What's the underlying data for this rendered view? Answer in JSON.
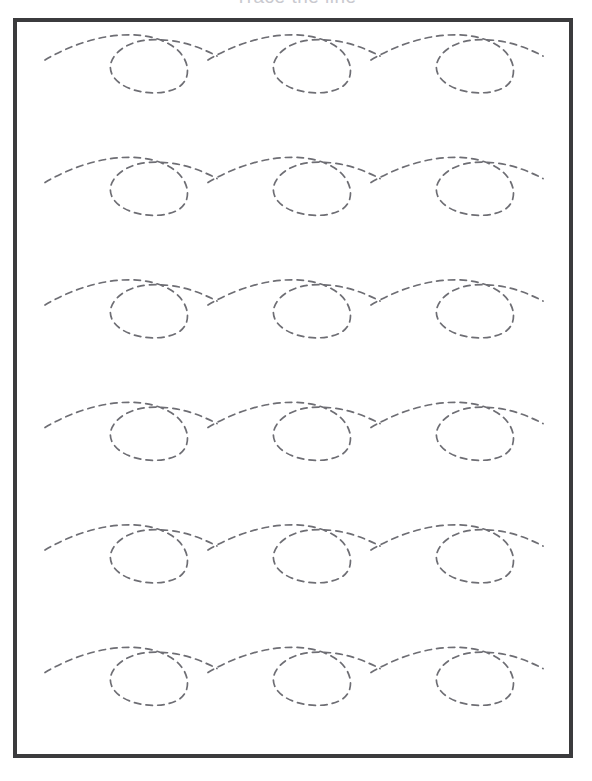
{
  "page": {
    "title": "Trace the line",
    "background_color": "#ffffff",
    "width": 592,
    "height": 781
  },
  "frame": {
    "border_color": "#3b3b3d",
    "border_width": 4,
    "x": 13,
    "y": 18,
    "width": 560,
    "height": 740
  },
  "tracing": {
    "name": "loop-curl-tracing-pattern",
    "stroke_color": "#6e6e74",
    "stroke_width": 1.7,
    "dash": "6.5 5.2",
    "rows": 6,
    "loops_per_row": 3,
    "row_spacing": 122.5,
    "loop_spacing": 163,
    "first_row_baseline": 42,
    "first_loop_x": 32,
    "path_template": "m 0 0 c 40 -24 92 -34 124 -16 c 22 12 24 36 8 44 c -20 10 -54 4 -64 -12 c -10 -16 10 -34 34 -36 c 30 -2 50 6 70 16",
    "rows_data": [
      {
        "index": 1,
        "label": "row-1",
        "baseline_y": 42
      },
      {
        "index": 2,
        "label": "row-2",
        "baseline_y": 164.5
      },
      {
        "index": 3,
        "label": "row-3",
        "baseline_y": 287
      },
      {
        "index": 4,
        "label": "row-4",
        "baseline_y": 409.5
      },
      {
        "index": 5,
        "label": "row-5",
        "baseline_y": 532
      },
      {
        "index": 6,
        "label": "row-6",
        "baseline_y": 654.5
      }
    ]
  }
}
